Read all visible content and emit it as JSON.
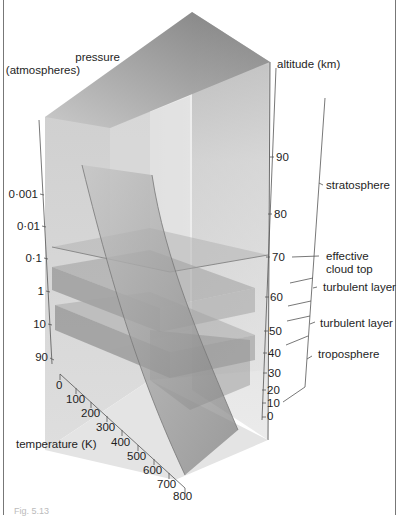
{
  "figure": {
    "caption": "Fig. 5.13"
  },
  "axes": {
    "pressure": {
      "title_line1": "pressure",
      "title_line2": "(atmospheres)",
      "ticks": [
        "0·001",
        "0·01",
        "0·1",
        "1",
        "10",
        "90"
      ]
    },
    "altitude": {
      "title": "altitude (km)",
      "ticks": [
        "90",
        "80",
        "70",
        "60",
        "50",
        "40",
        "30",
        "20",
        "10",
        "0"
      ]
    },
    "temperature": {
      "title": "temperature (K)",
      "ticks": [
        "0",
        "100",
        "200",
        "300",
        "400",
        "500",
        "600",
        "700",
        "800"
      ]
    }
  },
  "layers": {
    "stratosphere": "stratosphere",
    "cloud_top_line1": "effective",
    "cloud_top_line2": "cloud top",
    "turbulent_upper": "turbulent layer",
    "turbulent_lower": "turbulent layer",
    "troposphere": "troposphere"
  },
  "colors": {
    "background": "#ffffff",
    "ink": "#1e1e1e",
    "box_dark": "#8a8a8a",
    "box_light": "#e6e6e6"
  }
}
